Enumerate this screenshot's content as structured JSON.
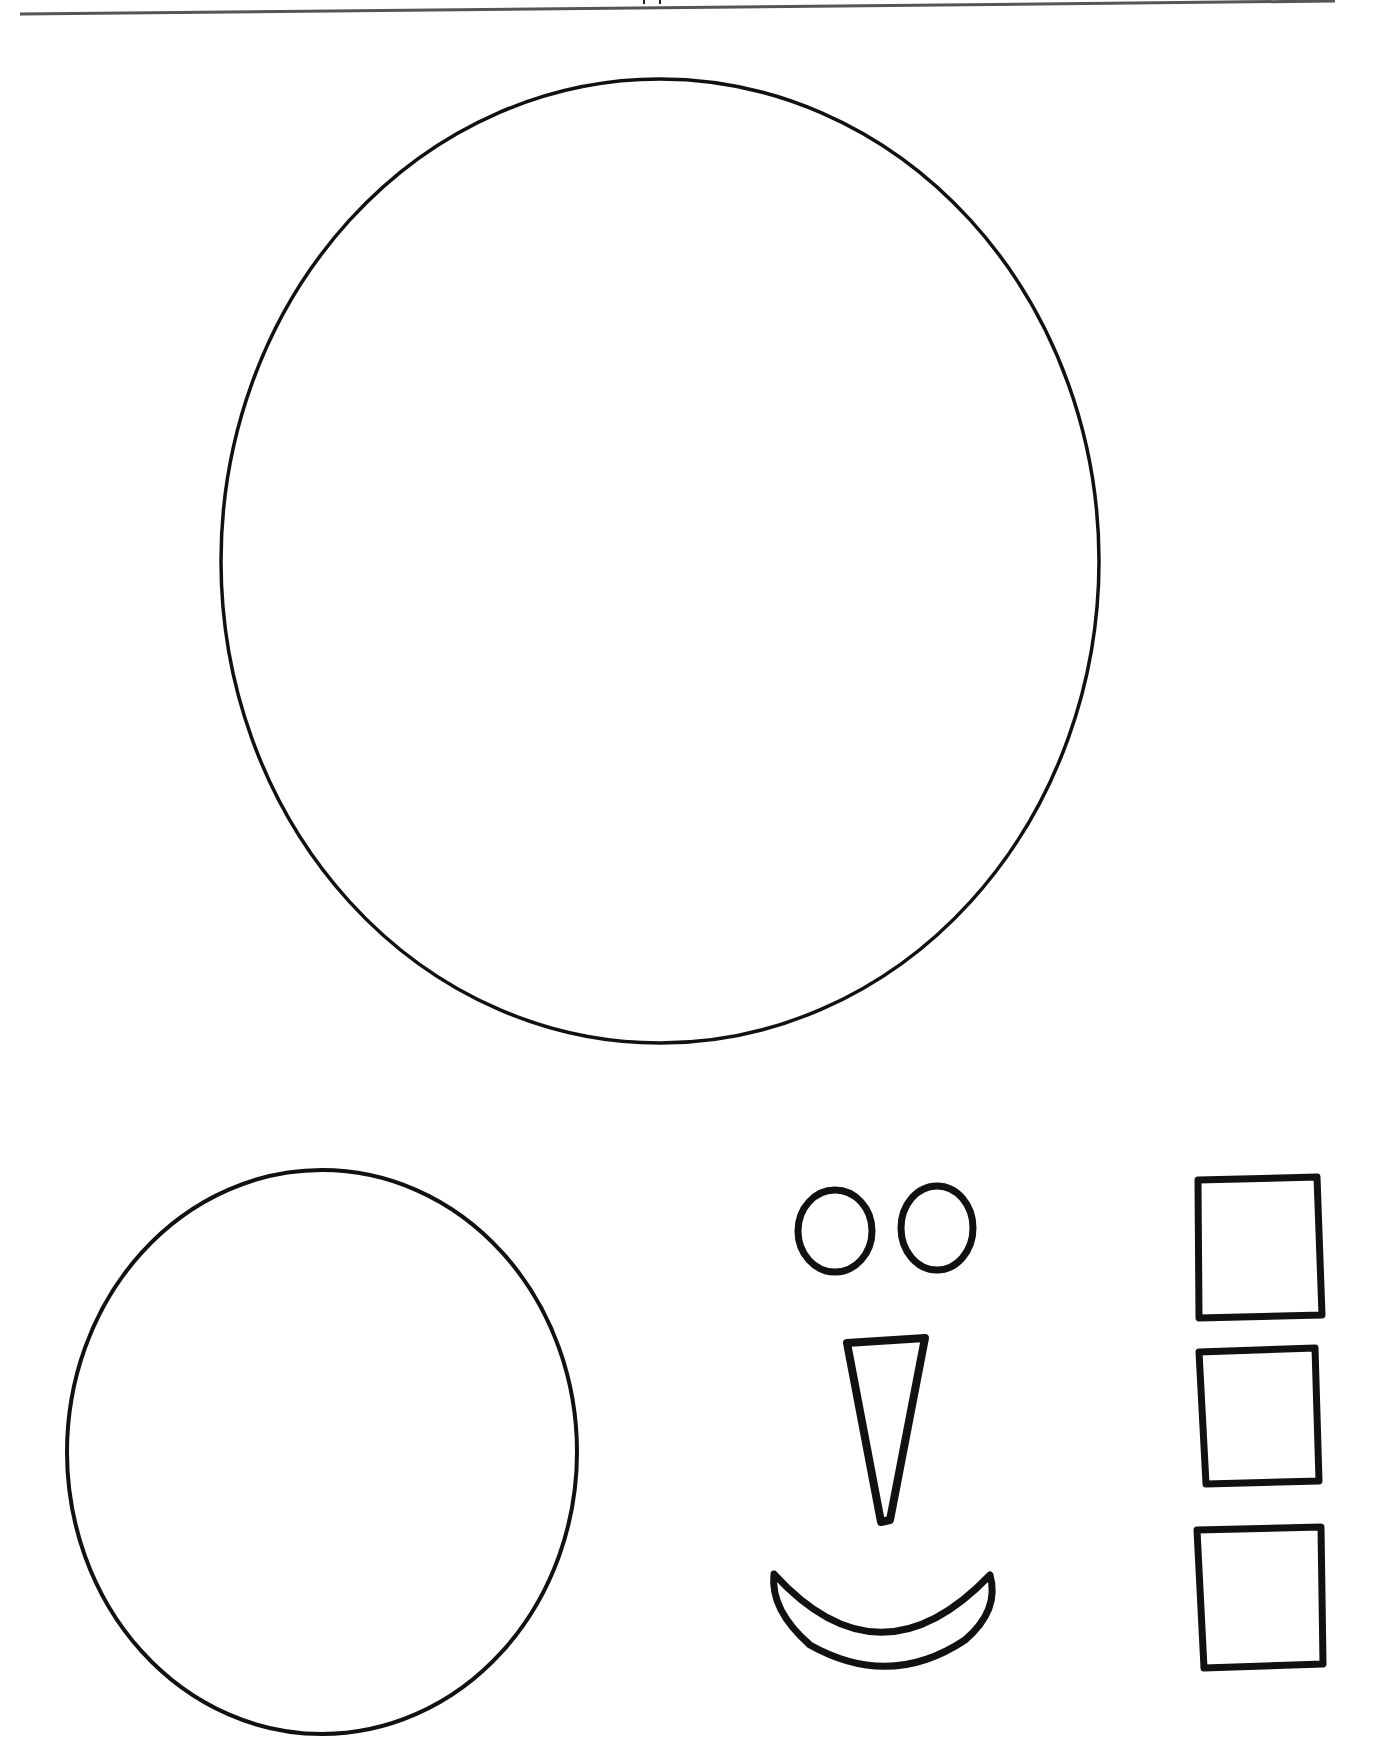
{
  "page": {
    "type": "printable cut-out template",
    "header_rule": true,
    "stroke_color": "#111111",
    "background": "#ffffff"
  },
  "shapes": [
    {
      "name": "large-circle",
      "label": "snowman body"
    },
    {
      "name": "small-circle",
      "label": "snowman head"
    },
    {
      "name": "eye-left",
      "label": "eye"
    },
    {
      "name": "eye-right",
      "label": "eye"
    },
    {
      "name": "nose-triangle",
      "label": "carrot nose"
    },
    {
      "name": "smile",
      "label": "mouth"
    },
    {
      "name": "square-1",
      "label": "button"
    },
    {
      "name": "square-2",
      "label": "button"
    },
    {
      "name": "square-3",
      "label": "button"
    }
  ]
}
